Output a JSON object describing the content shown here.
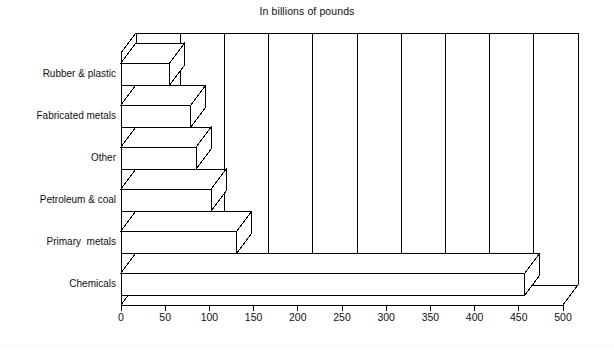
{
  "chart_data": {
    "type": "bar",
    "orientation": "horizontal",
    "title": "In billions of pounds",
    "xlabel": "",
    "ylabel": "",
    "categories": [
      "Chemicals",
      "Primary  metals",
      "Petroleum & coal",
      "Other",
      "Fabricated metals",
      "Rubber & plastic"
    ],
    "values": [
      457,
      131,
      102,
      85,
      79,
      55
    ],
    "xlim": [
      0,
      500
    ],
    "xticks": [
      0,
      50,
      100,
      150,
      200,
      250,
      300,
      350,
      400,
      450,
      500
    ],
    "xticklabels": [
      "0",
      "50",
      "100",
      "150",
      "200",
      "250",
      "300",
      "350",
      "400",
      "450",
      "500"
    ],
    "grid": "vertical",
    "legend": null,
    "style": {
      "bar_fill": "#ffffff",
      "bar_stroke": "#000000",
      "axis_color": "#000000",
      "grid_color": "#000000",
      "background": "#ffffff",
      "three_d": true
    }
  },
  "labels": {
    "y": [
      "Rubber & plastic",
      "Fabricated metals",
      "Other",
      "Petroleum & coal",
      "Primary  metals",
      "Chemicals"
    ]
  }
}
